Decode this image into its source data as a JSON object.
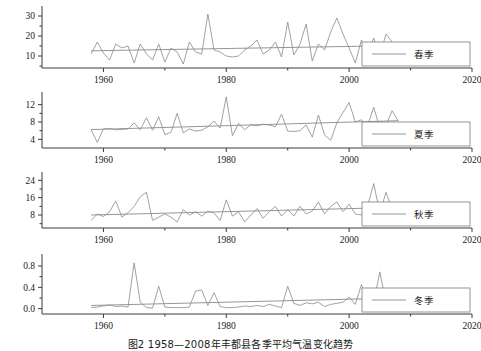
{
  "figure": {
    "caption": "图2 1958—2008年丰都县各季平均气温变化趋势"
  },
  "chart_data": {
    "type": "line",
    "title": "图2 1958—2008年丰都县各季平均气温变化趋势",
    "xlabel": "",
    "ylabel": "",
    "xlim": [
      1950,
      2020
    ],
    "x_major_ticks": [
      1960,
      1980,
      2000,
      2020
    ],
    "x_minor_ticks": [
      1970,
      1990,
      2010
    ],
    "x_tick_labels": [
      "1960",
      "1980",
      "2000",
      "2020"
    ],
    "grid": false,
    "legend_position": "right",
    "x": [
      1958,
      1959,
      1960,
      1961,
      1962,
      1963,
      1964,
      1965,
      1966,
      1967,
      1968,
      1969,
      1970,
      1971,
      1972,
      1973,
      1974,
      1975,
      1976,
      1977,
      1978,
      1979,
      1980,
      1981,
      1982,
      1983,
      1984,
      1985,
      1986,
      1987,
      1988,
      1989,
      1990,
      1991,
      1992,
      1993,
      1994,
      1995,
      1996,
      1997,
      1998,
      1999,
      2000,
      2001,
      2002,
      2003,
      2004,
      2005,
      2006,
      2007,
      2008
    ],
    "panels": [
      {
        "name": "spring",
        "legend": "春季",
        "ylim": [
          4,
          33
        ],
        "yticks": [
          10,
          20,
          30
        ],
        "ytick_labels": [
          "10",
          "20",
          "30"
        ],
        "series": [
          {
            "name": "春季",
            "type": "observed",
            "values": [
              11.0,
              17.0,
              11.5,
              8.0,
              16.0,
              14.0,
              15.0,
              6.5,
              16.0,
              11.0,
              8.0,
              16.0,
              7.0,
              14.0,
              12.0,
              6.0,
              17.0,
              12.0,
              11.0,
              31.0,
              13.0,
              12.0,
              10.0,
              9.5,
              10.0,
              13.0,
              15.0,
              18.0,
              11.0,
              13.0,
              17.0,
              9.5,
              27.0,
              10.5,
              16.0,
              26.0,
              7.5,
              16.0,
              13.0,
              22.0,
              29.0,
              21.0,
              14.0,
              6.5,
              18.0,
              10.0,
              19.0,
              10.0,
              21.0,
              17.0,
              14.0
            ]
          },
          {
            "name": "趋势线",
            "type": "trend",
            "start_value": 12.6,
            "end_value": 15.2
          }
        ]
      },
      {
        "name": "summer",
        "legend": "夏季",
        "ylim": [
          2,
          14
        ],
        "yticks": [
          4,
          8,
          12
        ],
        "ytick_labels": [
          "4",
          "8",
          "12"
        ],
        "series": [
          {
            "name": "夏季",
            "type": "observed",
            "values": [
              6.2,
              3.3,
              6.4,
              6.5,
              6.2,
              6.3,
              6.4,
              7.8,
              6.2,
              9.0,
              6.1,
              9.2,
              5.1,
              5.6,
              10.0,
              5.5,
              6.4,
              5.9,
              6.1,
              6.9,
              8.2,
              6.6,
              13.8,
              4.8,
              7.7,
              6.2,
              7.4,
              7.1,
              7.5,
              7.3,
              6.9,
              9.8,
              5.9,
              5.8,
              6.0,
              7.3,
              4.5,
              9.6,
              5.0,
              3.8,
              7.8,
              10.2,
              12.5,
              8.0,
              8.5,
              7.2,
              11.4,
              6.6,
              7.3,
              10.6,
              8.2
            ]
          },
          {
            "name": "趋势线",
            "type": "trend",
            "start_value": 6.25,
            "end_value": 8.3
          }
        ]
      },
      {
        "name": "autumn",
        "legend": "秋季",
        "ylim": [
          2,
          26
        ],
        "yticks": [
          8,
          16,
          24
        ],
        "ytick_labels": [
          "8",
          "16",
          "24"
        ],
        "series": [
          {
            "name": "秋季",
            "type": "observed",
            "values": [
              5.5,
              8.5,
              7.3,
              9.5,
              14.5,
              7.0,
              9.0,
              12.0,
              16.5,
              18.5,
              5.5,
              7.0,
              8.5,
              7.0,
              4.8,
              10.5,
              8.0,
              9.5,
              7.5,
              9.8,
              9.0,
              5.5,
              15.0,
              7.5,
              9.5,
              4.8,
              8.0,
              11.0,
              6.5,
              9.5,
              12.0,
              7.5,
              10.5,
              7.5,
              12.0,
              8.5,
              9.8,
              14.0,
              8.5,
              12.0,
              14.0,
              9.5,
              13.0,
              8.5,
              8.0,
              12.0,
              22.5,
              9.0,
              18.5,
              10.5,
              12.0
            ]
          },
          {
            "name": "趋势线",
            "type": "trend",
            "start_value": 8.0,
            "end_value": 11.5
          }
        ]
      },
      {
        "name": "winter",
        "legend": "冬季",
        "ylim": [
          -0.1,
          0.95
        ],
        "yticks": [
          0.0,
          0.4,
          0.8
        ],
        "ytick_labels": [
          "0.0",
          "0.4",
          "0.8"
        ],
        "series": [
          {
            "name": "冬季",
            "type": "observed",
            "values": [
              0.02,
              0.03,
              0.05,
              0.07,
              0.04,
              0.05,
              0.03,
              0.86,
              0.12,
              0.02,
              0.01,
              0.42,
              0.03,
              0.02,
              0.02,
              0.02,
              0.03,
              0.33,
              0.35,
              0.06,
              0.3,
              0.04,
              0.02,
              0.02,
              0.03,
              0.05,
              0.04,
              0.06,
              0.04,
              0.08,
              0.05,
              0.02,
              0.42,
              0.1,
              0.06,
              0.11,
              0.09,
              0.12,
              0.04,
              0.08,
              0.1,
              0.12,
              0.22,
              0.08,
              0.45,
              0.17,
              0.12,
              0.69,
              0.1,
              0.04,
              0.02
            ]
          },
          {
            "name": "趋势线",
            "type": "trend",
            "start_value": 0.06,
            "end_value": 0.2
          }
        ]
      }
    ]
  },
  "colors": {
    "line": "#8a8a8a",
    "axis": "#3a3a3a",
    "text": "#1a1a1a",
    "background": "#ffffff"
  }
}
